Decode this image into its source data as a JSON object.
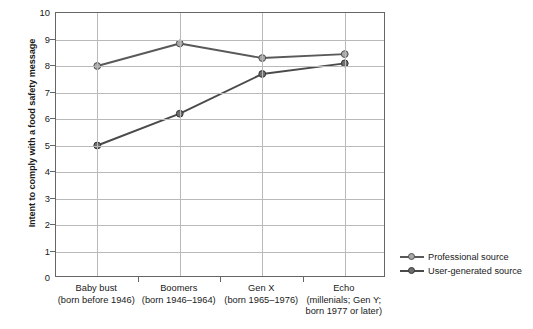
{
  "chart_data": {
    "type": "line",
    "title": "",
    "xlabel": "",
    "ylabel": "Intent to comply with a food safety message",
    "ylim": [
      0,
      10
    ],
    "ytick_labels": [
      "10",
      "9",
      "8",
      "7",
      "6",
      "5",
      "4",
      "3",
      "2",
      "1",
      "0"
    ],
    "ytick_values": [
      10,
      9,
      8,
      7,
      6,
      5,
      4,
      3,
      2,
      1,
      0
    ],
    "grid": true,
    "legend_position": "right-bottom",
    "categories": [
      "Baby bust",
      "Boomers",
      "Gen X",
      "Echo"
    ],
    "category_sublabels": [
      [
        "(born before 1946)"
      ],
      [
        "(born 1946–1964)"
      ],
      [
        "(born 1965–1976)"
      ],
      [
        "(millenials; Gen Y;",
        "born 1977 or later)"
      ]
    ],
    "series": [
      {
        "name": "Professional source",
        "values": [
          8.0,
          8.85,
          8.3,
          8.45
        ],
        "color": "#595959",
        "marker_fill": "#a8a8a8",
        "marker_stroke": "#4d4d4d"
      },
      {
        "name": "User-generated source",
        "values": [
          5.0,
          6.2,
          7.7,
          8.1
        ],
        "color": "#4a4a4a",
        "marker_fill": "#6e6e6e",
        "marker_stroke": "#333333"
      }
    ]
  },
  "legend": {
    "items": [
      {
        "label": "Professional source"
      },
      {
        "label": "User-generated source"
      }
    ]
  },
  "colors": {
    "axis": "#666666",
    "grid": "#b9b9b9",
    "text": "#1a1a1a",
    "background": "#ffffff"
  }
}
